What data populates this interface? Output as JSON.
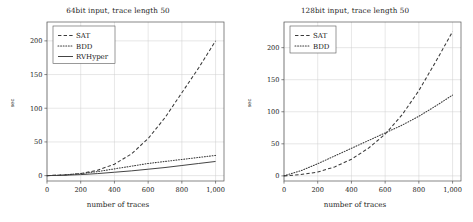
{
  "figure": {
    "background": "#ffffff",
    "axis_color": "#555555",
    "grid_color": "#cfcfcf",
    "text_color": "#1a1a1a"
  },
  "panels": [
    {
      "id": "left",
      "title": "64bit input, trace length 50",
      "xlabel": "number of traces",
      "ylabel": "sec",
      "legend_position": "top-left",
      "xticks": [
        "0",
        "200",
        "400",
        "600",
        "800",
        "1,000"
      ],
      "yticks": [
        "0",
        "50",
        "100",
        "150",
        "200"
      ],
      "legend": [
        {
          "label": "SAT",
          "style": "dashed"
        },
        {
          "label": "BDD",
          "style": "dotted"
        },
        {
          "label": "RVHyper",
          "style": "solid"
        }
      ]
    },
    {
      "id": "right",
      "title": "128bit input, trace length 50",
      "xlabel": "number of traces",
      "ylabel": "sec",
      "legend_position": "top-left",
      "xticks": [
        "0",
        "200",
        "400",
        "600",
        "800",
        "1,000"
      ],
      "yticks": [
        "0",
        "50",
        "100",
        "150",
        "200"
      ],
      "legend": [
        {
          "label": "SAT",
          "style": "dashed"
        },
        {
          "label": "BDD",
          "style": "dotted"
        }
      ]
    }
  ],
  "chart_data": [
    {
      "type": "line",
      "panel": "left",
      "title": "64bit input, trace length 50",
      "xlabel": "number of traces",
      "ylabel": "sec",
      "xlim": [
        0,
        1050
      ],
      "ylim": [
        -8,
        228
      ],
      "grid": true,
      "legend": [
        "SAT",
        "BDD",
        "RVHyper"
      ],
      "x": [
        0,
        100,
        200,
        300,
        400,
        500,
        600,
        700,
        800,
        900,
        1000
      ],
      "series": [
        {
          "name": "SAT",
          "style": "dashed",
          "values": [
            0,
            1,
            3,
            8,
            17,
            32,
            55,
            86,
            123,
            160,
            200
          ]
        },
        {
          "name": "BDD",
          "style": "dotted",
          "values": [
            0,
            1,
            3,
            6,
            10,
            14,
            18,
            21,
            24,
            27,
            30
          ]
        },
        {
          "name": "RVHyper",
          "style": "solid",
          "values": [
            0,
            0.5,
            1.5,
            3,
            5,
            7,
            9.5,
            12,
            15,
            18,
            21
          ]
        }
      ]
    },
    {
      "type": "line",
      "panel": "right",
      "title": "128bit input, trace length 50",
      "xlabel": "number of traces",
      "ylabel": "sec",
      "xlim": [
        0,
        1050
      ],
      "ylim": [
        -8,
        240
      ],
      "grid": true,
      "legend": [
        "SAT",
        "BDD"
      ],
      "x": [
        0,
        100,
        200,
        300,
        400,
        500,
        600,
        700,
        800,
        900,
        1000
      ],
      "series": [
        {
          "name": "SAT",
          "style": "dashed",
          "values": [
            0,
            2,
            6,
            14,
            26,
            43,
            65,
            95,
            133,
            178,
            225
          ]
        },
        {
          "name": "BDD",
          "style": "dotted",
          "values": [
            0,
            8,
            19,
            31,
            43,
            55,
            67,
            79,
            93,
            109,
            126
          ]
        }
      ]
    }
  ]
}
